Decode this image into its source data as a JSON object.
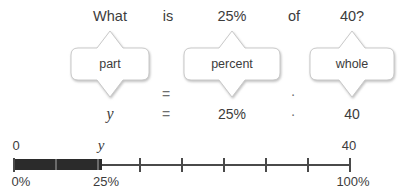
{
  "problem": {
    "words": [
      {
        "text": "What",
        "center": 110
      },
      {
        "text": "is",
        "center": 168
      },
      {
        "text": "25%",
        "center": 232
      },
      {
        "text": "of",
        "center": 294
      },
      {
        "text": "40?",
        "center": 352
      }
    ]
  },
  "formula": {
    "callouts": [
      {
        "label": "part",
        "center": 110,
        "width": 78
      },
      {
        "label": "percent",
        "center": 232,
        "width": 96
      },
      {
        "label": "whole",
        "center": 352,
        "width": 84
      }
    ],
    "operators": [
      {
        "symbol": "=",
        "center": 166,
        "top": 56
      },
      {
        "symbol": "·",
        "center": 293,
        "top": 56
      }
    ]
  },
  "equation": {
    "terms": [
      {
        "text": "y",
        "center": 110,
        "style": "italic"
      },
      {
        "text": "=",
        "center": 166,
        "style": "operator"
      },
      {
        "text": "25%",
        "center": 232,
        "style": "plain"
      },
      {
        "text": "·",
        "center": 293,
        "style": "operator"
      },
      {
        "text": "40",
        "center": 352,
        "style": "plain"
      }
    ]
  },
  "number_line": {
    "axis": {
      "start_x": 14,
      "end_x": 350
    },
    "filled_bar": {
      "start_x": 14,
      "end_x": 102
    },
    "ticks": [
      14,
      56,
      98,
      140,
      182,
      224,
      266,
      308,
      350
    ],
    "ticks_on_bar": [
      56,
      98
    ],
    "top_labels": [
      {
        "text": "0",
        "center": 16,
        "style": "plain"
      },
      {
        "text": "y",
        "center": 101,
        "style": "italic"
      },
      {
        "text": "40",
        "center": 349,
        "style": "plain"
      }
    ],
    "bottom_labels": [
      {
        "text": "0%",
        "center": 21
      },
      {
        "text": "25%",
        "center": 106
      },
      {
        "text": "100%",
        "center": 353
      }
    ]
  },
  "colors": {
    "text": "#3c3c3c",
    "operator": "#6e6e6e",
    "axis": "#4a4a4a",
    "bar_fill": "#2b2b2b",
    "callout_stroke": "#c9c9c9",
    "callout_fill": "#ffffff",
    "background": "#ffffff"
  }
}
